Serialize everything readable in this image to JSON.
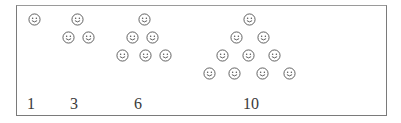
{
  "diagram": {
    "icon": "smiley-face-icon",
    "colors": {
      "border": "#7a7a7a",
      "icon_stroke": "#555555",
      "label": "#3a3a3a"
    },
    "groups": [
      {
        "label": "1",
        "label_x": 31,
        "rows": [
          [
            34
          ]
        ],
        "count": 1
      },
      {
        "label": "3",
        "label_x": 74,
        "rows": [
          [
            77
          ],
          [
            68,
            88
          ]
        ],
        "count": 3
      },
      {
        "label": "6",
        "label_x": 138,
        "rows": [
          [
            144
          ],
          [
            132,
            152
          ],
          [
            122,
            145,
            165
          ]
        ],
        "count": 6
      },
      {
        "label": "10",
        "label_x": 251,
        "rows": [
          [
            249
          ],
          [
            236,
            263
          ],
          [
            222,
            248,
            274
          ],
          [
            209,
            234,
            262,
            289
          ]
        ],
        "count": 10
      }
    ],
    "row_y": [
      19,
      37,
      55,
      73
    ],
    "label_y": 96
  }
}
